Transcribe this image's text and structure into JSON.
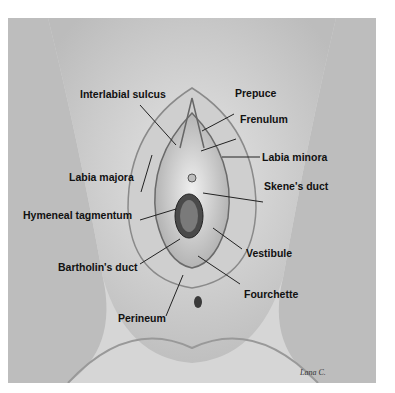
{
  "figure": {
    "labels": {
      "interlabial_sulcus": "Interlabial sulcus",
      "prepuce": "Prepuce",
      "frenulum": "Frenulum",
      "labia_minora": "Labia minora",
      "labia_majora": "Labia majora",
      "skenes_duct": "Skene's duct",
      "hymeneal_tagmentum": "Hymeneal tagmentum",
      "vestibule": "Vestibule",
      "bartholins_duct": "Bartholin's duct",
      "fourchette": "Fourchette",
      "perineum": "Perineum"
    },
    "signature": "Lana C."
  }
}
